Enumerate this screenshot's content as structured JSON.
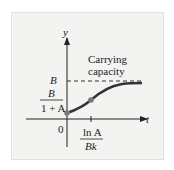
{
  "diagram": {
    "type": "logistic-growth-graph",
    "axes": {
      "y_label": "y",
      "x_label": "t",
      "origin_label": "0"
    },
    "asymptote": {
      "label_value": "B",
      "annotation_line1": "Carrying",
      "annotation_line2": "capacity"
    },
    "y_intercept": {
      "numerator": "B",
      "denominator": "1 + A"
    },
    "inflection_t": {
      "numerator": "ln A",
      "denominator": "Bk"
    },
    "colors": {
      "curve": "#333333",
      "point": "#7a7a7a",
      "axis": "#222222",
      "background": "#f3f3f1"
    }
  }
}
